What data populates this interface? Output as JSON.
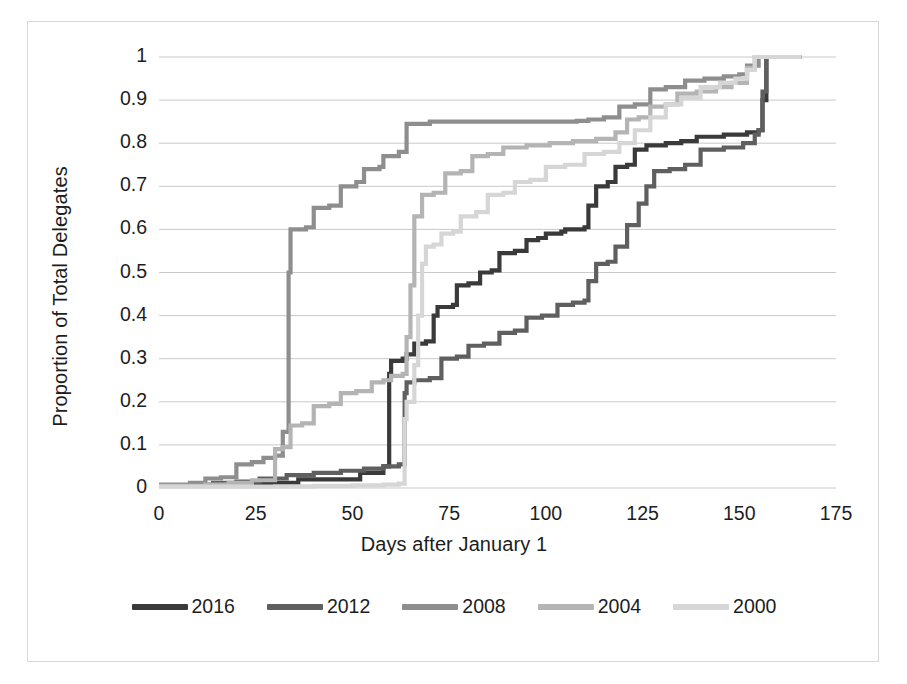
{
  "chart_data": {
    "type": "line",
    "title": "",
    "subtitle": "",
    "xlabel": "Days after January 1",
    "ylabel": "Proportion of Total Delegates",
    "xlim": [
      0,
      175
    ],
    "ylim": [
      0,
      1
    ],
    "xticks": [
      "0",
      "25",
      "50",
      "75",
      "100",
      "125",
      "150",
      "175"
    ],
    "yticks": [
      "0",
      "0.1",
      "0.2",
      "0.3",
      "0.4",
      "0.5",
      "0.6",
      "0.7",
      "0.8",
      "0.9",
      "1"
    ],
    "grid": "horizontal",
    "legend_position": "bottom",
    "line_style": "step",
    "series": [
      {
        "name": "2016",
        "color": "#3a3a3a",
        "points": [
          [
            0,
            0.005
          ],
          [
            22,
            0.005
          ],
          [
            23,
            0.012
          ],
          [
            30,
            0.012
          ],
          [
            36,
            0.02
          ],
          [
            44,
            0.02
          ],
          [
            52,
            0.035
          ],
          [
            56,
            0.035
          ],
          [
            58,
            0.05
          ],
          [
            59,
            0.05
          ],
          [
            59.5,
            0.265
          ],
          [
            60,
            0.295
          ],
          [
            63,
            0.3
          ],
          [
            64,
            0.31
          ],
          [
            66,
            0.335
          ],
          [
            69,
            0.34
          ],
          [
            71,
            0.4
          ],
          [
            72,
            0.42
          ],
          [
            76,
            0.425
          ],
          [
            77,
            0.47
          ],
          [
            80,
            0.475
          ],
          [
            83,
            0.5
          ],
          [
            86,
            0.505
          ],
          [
            88,
            0.545
          ],
          [
            92,
            0.55
          ],
          [
            95,
            0.575
          ],
          [
            98,
            0.58
          ],
          [
            100,
            0.59
          ],
          [
            104,
            0.595
          ],
          [
            105,
            0.6
          ],
          [
            110,
            0.605
          ],
          [
            111,
            0.655
          ],
          [
            113,
            0.7
          ],
          [
            116,
            0.71
          ],
          [
            118,
            0.745
          ],
          [
            121,
            0.75
          ],
          [
            123,
            0.785
          ],
          [
            126,
            0.795
          ],
          [
            131,
            0.8
          ],
          [
            135,
            0.805
          ],
          [
            139,
            0.815
          ],
          [
            146,
            0.82
          ],
          [
            152,
            0.825
          ],
          [
            155,
            0.83
          ],
          [
            156,
            0.9
          ],
          [
            157,
            1.0
          ],
          [
            166,
            1.0
          ]
        ]
      },
      {
        "name": "2012",
        "color": "#5f5f5f",
        "points": [
          [
            0,
            0.005
          ],
          [
            10,
            0.008
          ],
          [
            14,
            0.012
          ],
          [
            20,
            0.015
          ],
          [
            26,
            0.022
          ],
          [
            33,
            0.03
          ],
          [
            40,
            0.035
          ],
          [
            47,
            0.04
          ],
          [
            53,
            0.045
          ],
          [
            58,
            0.05
          ],
          [
            62,
            0.055
          ],
          [
            63,
            0.055
          ],
          [
            63.5,
            0.22
          ],
          [
            64,
            0.245
          ],
          [
            66,
            0.25
          ],
          [
            70,
            0.255
          ],
          [
            73,
            0.3
          ],
          [
            77,
            0.305
          ],
          [
            80,
            0.33
          ],
          [
            84,
            0.335
          ],
          [
            88,
            0.36
          ],
          [
            92,
            0.365
          ],
          [
            95,
            0.395
          ],
          [
            99,
            0.4
          ],
          [
            103,
            0.425
          ],
          [
            107,
            0.43
          ],
          [
            110,
            0.435
          ],
          [
            111,
            0.48
          ],
          [
            113,
            0.52
          ],
          [
            116,
            0.525
          ],
          [
            118,
            0.56
          ],
          [
            121,
            0.61
          ],
          [
            124,
            0.66
          ],
          [
            126,
            0.7
          ],
          [
            128,
            0.735
          ],
          [
            132,
            0.74
          ],
          [
            136,
            0.75
          ],
          [
            140,
            0.785
          ],
          [
            146,
            0.79
          ],
          [
            151,
            0.8
          ],
          [
            154,
            0.82
          ],
          [
            155,
            0.83
          ],
          [
            156,
            0.92
          ],
          [
            157,
            1.0
          ],
          [
            166,
            1.0
          ]
        ]
      },
      {
        "name": "2008",
        "color": "#8e8e8e",
        "points": [
          [
            0,
            0.008
          ],
          [
            8,
            0.012
          ],
          [
            12,
            0.022
          ],
          [
            16,
            0.025
          ],
          [
            20,
            0.055
          ],
          [
            24,
            0.06
          ],
          [
            27,
            0.07
          ],
          [
            30,
            0.075
          ],
          [
            32,
            0.13
          ],
          [
            33,
            0.13
          ],
          [
            33.5,
            0.5
          ],
          [
            34,
            0.6
          ],
          [
            38,
            0.605
          ],
          [
            40,
            0.65
          ],
          [
            44,
            0.655
          ],
          [
            47,
            0.7
          ],
          [
            51,
            0.71
          ],
          [
            53,
            0.74
          ],
          [
            57,
            0.745
          ],
          [
            58,
            0.77
          ],
          [
            62,
            0.78
          ],
          [
            64,
            0.845
          ],
          [
            70,
            0.85
          ],
          [
            80,
            0.85
          ],
          [
            90,
            0.85
          ],
          [
            100,
            0.85
          ],
          [
            108,
            0.852
          ],
          [
            111,
            0.855
          ],
          [
            115,
            0.86
          ],
          [
            119,
            0.885
          ],
          [
            123,
            0.89
          ],
          [
            127,
            0.925
          ],
          [
            131,
            0.93
          ],
          [
            136,
            0.945
          ],
          [
            141,
            0.95
          ],
          [
            146,
            0.955
          ],
          [
            150,
            0.96
          ],
          [
            152,
            0.98
          ],
          [
            155,
            1.0
          ],
          [
            166,
            1.0
          ]
        ]
      },
      {
        "name": "2004",
        "color": "#b4b4b4",
        "points": [
          [
            0,
            0.005
          ],
          [
            12,
            0.008
          ],
          [
            18,
            0.012
          ],
          [
            24,
            0.018
          ],
          [
            30,
            0.09
          ],
          [
            32,
            0.095
          ],
          [
            34,
            0.145
          ],
          [
            37,
            0.15
          ],
          [
            40,
            0.19
          ],
          [
            44,
            0.195
          ],
          [
            47,
            0.22
          ],
          [
            51,
            0.225
          ],
          [
            55,
            0.245
          ],
          [
            58,
            0.25
          ],
          [
            60,
            0.26
          ],
          [
            63,
            0.265
          ],
          [
            64,
            0.35
          ],
          [
            65,
            0.47
          ],
          [
            66,
            0.63
          ],
          [
            68,
            0.68
          ],
          [
            71,
            0.685
          ],
          [
            74,
            0.73
          ],
          [
            78,
            0.735
          ],
          [
            81,
            0.77
          ],
          [
            85,
            0.775
          ],
          [
            89,
            0.79
          ],
          [
            95,
            0.795
          ],
          [
            101,
            0.8
          ],
          [
            107,
            0.805
          ],
          [
            113,
            0.81
          ],
          [
            118,
            0.825
          ],
          [
            121,
            0.855
          ],
          [
            124,
            0.86
          ],
          [
            127,
            0.885
          ],
          [
            131,
            0.89
          ],
          [
            134,
            0.915
          ],
          [
            139,
            0.92
          ],
          [
            144,
            0.93
          ],
          [
            148,
            0.94
          ],
          [
            152,
            0.975
          ],
          [
            154,
            1.0
          ],
          [
            166,
            1.0
          ]
        ]
      },
      {
        "name": "2000",
        "color": "#d6d6d6",
        "points": [
          [
            0,
            0.003
          ],
          [
            20,
            0.003
          ],
          [
            30,
            0.004
          ],
          [
            40,
            0.005
          ],
          [
            50,
            0.006
          ],
          [
            58,
            0.008
          ],
          [
            62,
            0.01
          ],
          [
            63,
            0.01
          ],
          [
            63.5,
            0.16
          ],
          [
            64,
            0.2
          ],
          [
            66,
            0.285
          ],
          [
            67,
            0.4
          ],
          [
            68,
            0.52
          ],
          [
            69,
            0.56
          ],
          [
            71,
            0.565
          ],
          [
            73,
            0.59
          ],
          [
            76,
            0.595
          ],
          [
            78,
            0.63
          ],
          [
            82,
            0.64
          ],
          [
            85,
            0.68
          ],
          [
            89,
            0.685
          ],
          [
            92,
            0.71
          ],
          [
            96,
            0.715
          ],
          [
            100,
            0.745
          ],
          [
            105,
            0.75
          ],
          [
            110,
            0.775
          ],
          [
            115,
            0.78
          ],
          [
            119,
            0.8
          ],
          [
            123,
            0.83
          ],
          [
            127,
            0.86
          ],
          [
            131,
            0.89
          ],
          [
            135,
            0.905
          ],
          [
            140,
            0.93
          ],
          [
            145,
            0.94
          ],
          [
            149,
            0.95
          ],
          [
            152,
            0.97
          ],
          [
            154,
            1.0
          ],
          [
            166,
            1.0
          ]
        ]
      }
    ]
  },
  "legend": {
    "items": [
      {
        "label": "2016",
        "color": "#3a3a3a"
      },
      {
        "label": "2012",
        "color": "#5f5f5f"
      },
      {
        "label": "2008",
        "color": "#8e8e8e"
      },
      {
        "label": "2004",
        "color": "#b4b4b4"
      },
      {
        "label": "2000",
        "color": "#d6d6d6"
      }
    ]
  },
  "style": {
    "gridline_color": "#c9c9c9",
    "frame_color": "#d8d8d8",
    "text_color": "#1d1d1d",
    "background": "#ffffff"
  }
}
